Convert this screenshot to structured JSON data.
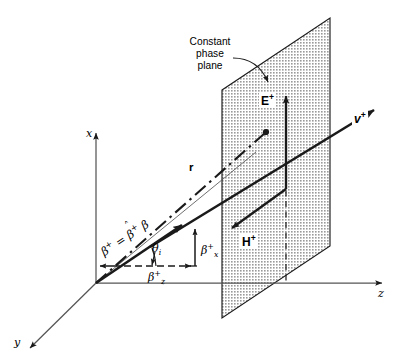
{
  "figure": {
    "kind": "3d-vector-diagram",
    "background_color": "#ffffff",
    "line_color": "#1a1a1a",
    "plane_fill_color": "#c9c9c9",
    "plane_edge_color": "#1a1a1a"
  },
  "axes": {
    "x_label": "x",
    "y_label": "y",
    "z_label": "z",
    "origin_label": ""
  },
  "callout": {
    "line1": "Constant",
    "line2": "phase",
    "line3": "plane"
  },
  "vectors": {
    "position_vector": "r",
    "electric_field": "E",
    "electric_field_sup": "+",
    "magnetic_field": "H",
    "magnetic_field_sup": "+",
    "velocity": "v",
    "velocity_sup": "+"
  },
  "beta": {
    "symbol": "β",
    "sup": "+",
    "equation_lhs": "β",
    "equation_lhs_sup": "+",
    "equation_eq": "=",
    "equation_unit": "β",
    "equation_unit_sup": "+",
    "equation_hat": "˄",
    "equation_rhs": "β",
    "component_x": "β",
    "component_x_sup": "+",
    "component_x_sub": "x",
    "component_z": "β",
    "component_z_sup": "+",
    "component_z_sub": "z"
  },
  "angle": {
    "symbol": "θ",
    "subscript": "i"
  }
}
